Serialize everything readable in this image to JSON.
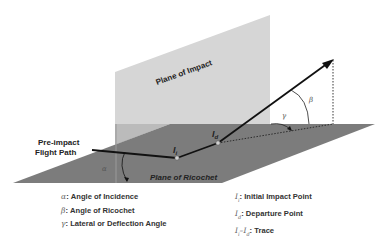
{
  "diagram": {
    "plane_of_impact_label": "Plane of Impact",
    "plane_of_ricochet_label": "Plane of Ricochet",
    "pre_impact_label_line1": "Pre-impact",
    "pre_impact_label_line2": "Flight Path",
    "point_initial": "I",
    "point_initial_sub": "i",
    "point_departure": "I",
    "point_departure_sub": "d",
    "angle_alpha": "α",
    "angle_beta": "β",
    "angle_gamma": "γ",
    "colors": {
      "plane_of_impact": "#d4d4d4",
      "plane_of_ricochet": "#7a7a7a",
      "path": "#111111"
    }
  },
  "legend": {
    "left": [
      {
        "symbol": "α",
        "text": ": Angle of Incidence"
      },
      {
        "symbol": "β",
        "text": ": Angle of Ricochet"
      },
      {
        "symbol": "γ",
        "text": ": Lateral or Deflection Angle"
      }
    ],
    "right": [
      {
        "symbol": "I",
        "sub": "i",
        "text": ": Initial Impact Point"
      },
      {
        "symbol": "I",
        "sub": "d",
        "text": ": Departure Point"
      },
      {
        "symbol": "I",
        "sub": "i",
        "dash": "–",
        "symbol2": "I",
        "sub2": "d",
        "text": ": Trace"
      }
    ]
  }
}
